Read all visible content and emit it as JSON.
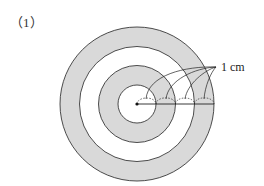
{
  "problem_label": "（1）",
  "annotation": "1 cm",
  "diagram": {
    "type": "concentric-circles",
    "rings": 4,
    "ring_width": "1 cm",
    "shaded_rings": [
      2,
      4
    ],
    "fill_color": "#d9d9d9",
    "stroke_color": "#222222"
  }
}
